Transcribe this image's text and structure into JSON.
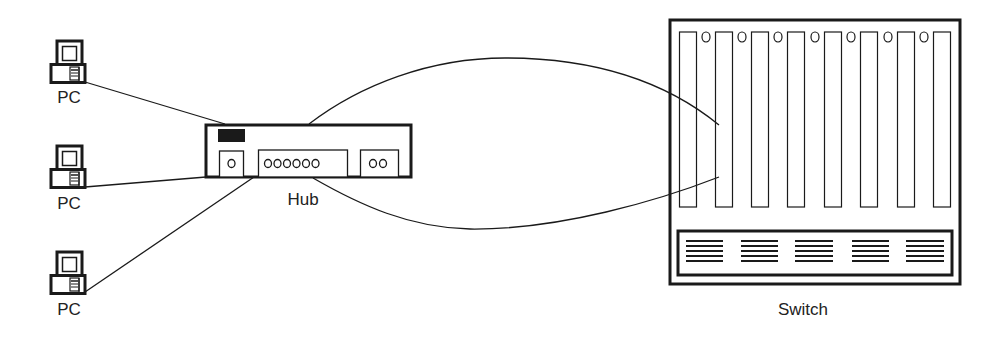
{
  "diagram": {
    "type": "network-topology",
    "nodes": [
      {
        "id": "pc1",
        "kind": "PC",
        "label": "PC"
      },
      {
        "id": "pc2",
        "kind": "PC",
        "label": "PC"
      },
      {
        "id": "pc3",
        "kind": "PC",
        "label": "PC"
      },
      {
        "id": "hub",
        "kind": "Hub",
        "label": "Hub",
        "port_groups": [
          1,
          6,
          2
        ]
      },
      {
        "id": "switch",
        "kind": "Switch",
        "label": "Switch",
        "slots": 8,
        "slot_leds": 7,
        "vent_groups": 5
      }
    ],
    "edges": [
      {
        "from": "pc1",
        "to": "hub",
        "style": "straight"
      },
      {
        "from": "pc2",
        "to": "hub",
        "style": "straight"
      },
      {
        "from": "pc3",
        "to": "hub",
        "style": "straight"
      },
      {
        "from": "hub",
        "to": "switch",
        "style": "curved-upper"
      },
      {
        "from": "hub",
        "to": "switch",
        "style": "curved-lower"
      }
    ]
  },
  "labels": {
    "pc1": "PC",
    "pc2": "PC",
    "pc3": "PC",
    "hub": "Hub",
    "switch": "Switch"
  },
  "colors": {
    "stroke": "#1a1a1a",
    "background": "#ffffff"
  }
}
